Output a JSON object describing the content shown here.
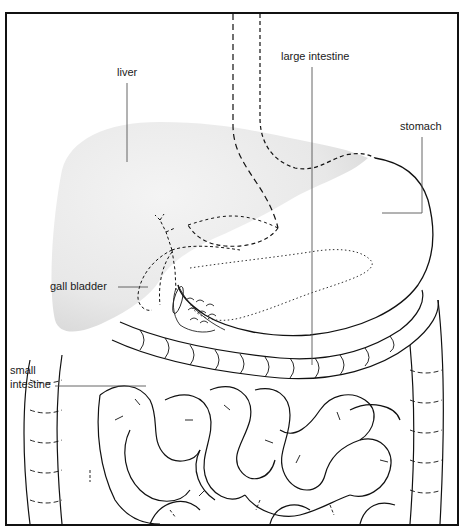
{
  "diagram": {
    "labels": {
      "liver": "liver",
      "large_intestine": "large intestine",
      "stomach": "stomach",
      "gall_bladder": "gall bladder",
      "small_intestine_line1": "small",
      "small_intestine_line2": "intestine"
    },
    "colors": {
      "ink": "#111111",
      "liver_fill": "#e6e6e6",
      "frame": "#111111",
      "background": "#ffffff"
    }
  }
}
